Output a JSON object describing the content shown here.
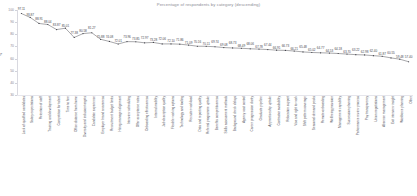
{
  "chart_data": {
    "type": "line",
    "title": "Percentage of respondents by category (descending)",
    "xlabel": "",
    "ylabel": "%",
    "ylim": [
      30,
      100
    ],
    "yticks": [
      30,
      40,
      50,
      60,
      70,
      80,
      90,
      100
    ],
    "grid": false,
    "legend_position": "none",
    "series": [
      {
        "name": "Percent",
        "values": [
          97.11,
          93.87,
          88.91,
          88.04,
          83.87,
          85.01,
          77.38,
          80.58,
          81.27,
          75.88,
          74.08,
          72.01,
          73.96,
          73.85,
          72.97,
          73.28,
          72.06,
          72.1,
          71.86,
          71.09,
          70.16,
          70.11,
          69.74,
          69.08,
          68.73,
          68.49,
          68.06,
          67.78,
          67.44,
          66.91,
          66.73,
          66.21,
          65.48,
          65.02,
          64.77,
          64.53,
          64.18,
          63.7,
          63.22,
          62.98,
          62.4,
          61.87,
          60.55,
          59.48,
          57.4
        ]
      }
    ],
    "categories": [
      "Lack of qualified candidates",
      "Salary expectations",
      "Retention of staff",
      "Training and development",
      "Competition for talent",
      "Time to hire",
      "Office distance from home",
      "Diversity and inclusion targets",
      "Candidate experience",
      "Employer brand awareness",
      "Recruitment budget limits",
      "Hiring manager alignment",
      "Interview scheduling",
      "Offer acceptance rates",
      "Onboarding effectiveness",
      "Internal mobility",
      "Job description quality",
      "Flexible working options",
      "Technology and tooling",
      "Recruiter workload",
      "Data and reporting quality",
      "Referral programme uptake",
      "Benefits competitiveness",
      "Skills assessment methods",
      "Background check delays",
      "Agency cost control",
      "Career progression clarity",
      "Graduate pipeline",
      "Apprenticeship uptake",
      "Contractor availability",
      "Relocation support",
      "Visa and right to work",
      "Shift pattern coverage",
      "Seasonal demand peaks",
      "Remote onboarding",
      "Wellbeing provision",
      "Management capability",
      "Succession planning",
      "Performance review process",
      "Pay transparency",
      "Union negotiations",
      "Absence management",
      "Exit interview insight",
      "Workforce planning",
      "Other"
    ]
  }
}
